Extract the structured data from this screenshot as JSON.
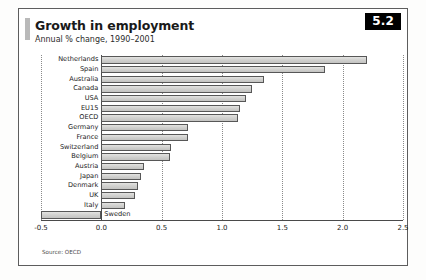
{
  "panel": {
    "title": "Growth in employment",
    "subtitle": "Annual % change, 1990–2001",
    "badge": "5.2",
    "source": "Source: OECD",
    "accent_color": "#000000",
    "bar_fill": "#d4d4d2",
    "bar_stroke": "#575757"
  },
  "chart_data": {
    "type": "bar",
    "orientation": "horizontal",
    "title": "Growth in employment",
    "subtitle": "Annual % change, 1990–2001",
    "xlabel": "",
    "ylabel": "",
    "xlim": [
      -0.5,
      2.5
    ],
    "xticks": [
      -0.5,
      0.0,
      0.5,
      1.0,
      1.5,
      2.0,
      2.5
    ],
    "xtick_labels": [
      "-0.5",
      "0.0",
      "0.5",
      "1.0",
      "1.5",
      "2.0",
      "2.5"
    ],
    "grid": "vertical-dotted",
    "legend": "none",
    "categories": [
      "Netherlands",
      "Spain",
      "Australia",
      "Canada",
      "USA",
      "EU15",
      "OECD",
      "Germany",
      "France",
      "Switzerland",
      "Belgium",
      "Austria",
      "Japan",
      "Denmark",
      "UK",
      "Italy",
      "Sweden"
    ],
    "values": [
      2.2,
      1.85,
      1.35,
      1.25,
      1.2,
      1.15,
      1.13,
      0.72,
      0.72,
      0.58,
      0.57,
      0.35,
      0.33,
      0.3,
      0.28,
      0.2,
      -0.5
    ]
  }
}
